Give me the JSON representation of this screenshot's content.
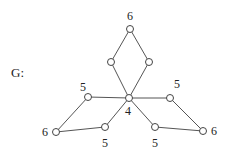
{
  "graph": {
    "name": "G:",
    "nodes": [
      {
        "id": "top",
        "x": 130,
        "y": 29,
        "label": "6",
        "lx": 130,
        "ly": 20
      },
      {
        "id": "top-left",
        "x": 111,
        "y": 62,
        "label": "",
        "lx": 0,
        "ly": 0
      },
      {
        "id": "top-right",
        "x": 149,
        "y": 62,
        "label": "",
        "lx": 0,
        "ly": 0
      },
      {
        "id": "center",
        "x": 129,
        "y": 98,
        "label": "4",
        "lx": 128,
        "ly": 115
      },
      {
        "id": "left-upper",
        "x": 88,
        "y": 97,
        "label": "5",
        "lx": 83,
        "ly": 91
      },
      {
        "id": "left-outer",
        "x": 56,
        "y": 132,
        "label": "6",
        "lx": 45,
        "ly": 136
      },
      {
        "id": "left-lower",
        "x": 105,
        "y": 127,
        "label": "5",
        "lx": 105,
        "ly": 147
      },
      {
        "id": "right-upper",
        "x": 170,
        "y": 98,
        "label": "5",
        "lx": 177,
        "ly": 88
      },
      {
        "id": "right-outer",
        "x": 203,
        "y": 131,
        "label": "6",
        "lx": 214,
        "ly": 135
      },
      {
        "id": "right-lower",
        "x": 155,
        "y": 127,
        "label": "5",
        "lx": 155,
        "ly": 147
      }
    ],
    "edges": [
      [
        "top",
        "top-left"
      ],
      [
        "top",
        "top-right"
      ],
      [
        "top-left",
        "center"
      ],
      [
        "top-right",
        "center"
      ],
      [
        "center",
        "left-upper"
      ],
      [
        "left-upper",
        "left-outer"
      ],
      [
        "left-outer",
        "left-lower"
      ],
      [
        "left-lower",
        "center"
      ],
      [
        "center",
        "right-upper"
      ],
      [
        "right-upper",
        "right-outer"
      ],
      [
        "right-outer",
        "right-lower"
      ],
      [
        "right-lower",
        "center"
      ]
    ],
    "node_radius": 3.5
  }
}
